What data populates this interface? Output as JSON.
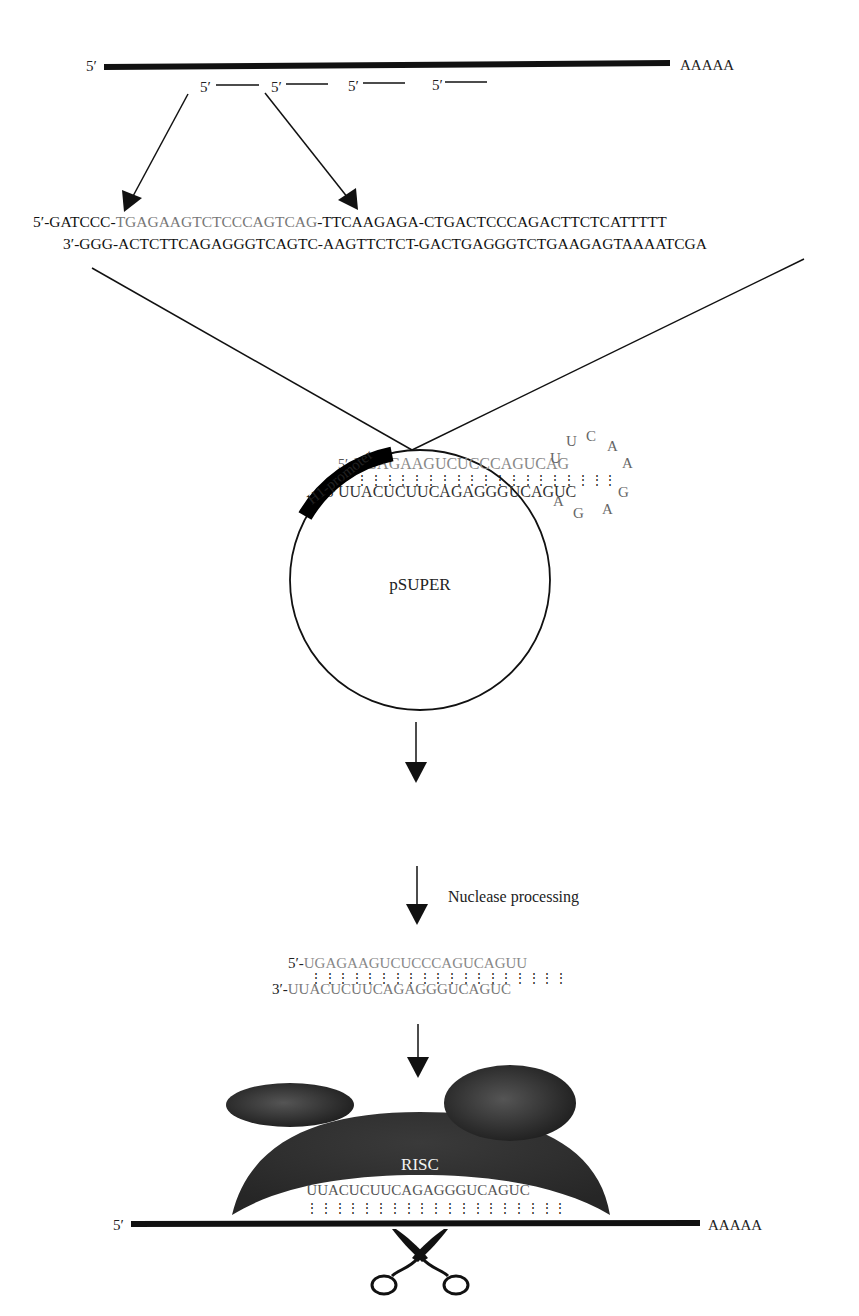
{
  "diagram": {
    "colors": {
      "ink": "#111111",
      "target_sequence": "#777777",
      "risc_body": "#333333",
      "background": "#ffffff"
    },
    "mrna_top": {
      "five_prime": "5′",
      "poly_a": "AAAAA",
      "target_sites": [
        {
          "label": "5′"
        },
        {
          "label": "5′"
        },
        {
          "label": "5′"
        },
        {
          "label": "5′"
        }
      ]
    },
    "oligo_insert": {
      "top_strand": {
        "prefix": "5′-GATCCC-",
        "sense": "TGAGAAGTCTCCCAGTCAG",
        "suffix": "-TTCAAGAGA-CTGACTCCCAGACTTCTCATTTTT"
      },
      "bottom_strand": "3′-GGG-ACTCTTCAGAGGGTCAGTC-AAGTTCTCT-GACTGAGGGTCTGAAGAGTAAAATCGA"
    },
    "vector": {
      "name": "pSUPER",
      "promoter_label": "H1-promoter",
      "hairpin": {
        "top_5prime": "5′",
        "top_strand": "UGAGAAGUCUCCCAGUCAG",
        "bottom_3prime": "3′",
        "bottom_strand": "UUACUCUUCAGAGGGUCAGUC",
        "loop": [
          "U",
          "U",
          "C",
          "A",
          "A",
          "G",
          "A",
          "G",
          "A"
        ]
      }
    },
    "steps": {
      "processing_label": "Nuclease processing"
    },
    "sirna": {
      "sense": {
        "prefix": "5′-",
        "sequence": "UGAGAAGUCUCCCAGUCAGUU"
      },
      "antisense": {
        "prefix": "3′-",
        "sequence": "UUACUCUUCAGAGGGUCAGUC"
      }
    },
    "risc": {
      "label": "RISC",
      "guide_strand": "UUACUCUUCAGAGGGUCAGUC",
      "target_mrna": {
        "five_prime": "5′",
        "poly_a": "AAAAA"
      },
      "cleavage_icon": "scissors-icon"
    },
    "pairing_dots": "⋮ ⋮ ⋮ ⋮ ⋮ ⋮ ⋮ ⋮ ⋮ ⋮ ⋮ ⋮ ⋮ ⋮ ⋮ ⋮ ⋮ ⋮ ⋮"
  }
}
